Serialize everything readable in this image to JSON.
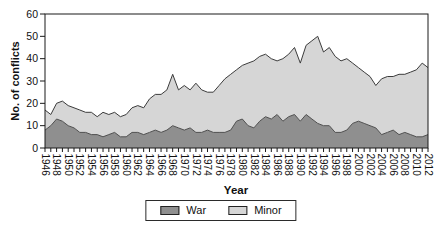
{
  "figure": {
    "ylabel": "No. of conflicts",
    "xlabel": "Year",
    "background": "#ffffff",
    "frame_color": "#1a1a1a"
  },
  "chart_data": {
    "type": "area",
    "stacked": true,
    "title": "",
    "xlabel": "Year",
    "ylabel": "No. of conflicts",
    "ylim": [
      0,
      60
    ],
    "yticks": [
      0,
      10,
      20,
      30,
      40,
      50,
      60
    ],
    "x_start": 1946,
    "x_end": 2012,
    "xtick_label_every": 2,
    "grid": false,
    "legend_position": "bottom-center",
    "x": [
      1946,
      1947,
      1948,
      1949,
      1950,
      1951,
      1952,
      1953,
      1954,
      1955,
      1956,
      1957,
      1958,
      1959,
      1960,
      1961,
      1962,
      1963,
      1964,
      1965,
      1966,
      1967,
      1968,
      1969,
      1970,
      1971,
      1972,
      1973,
      1974,
      1975,
      1976,
      1977,
      1978,
      1979,
      1980,
      1981,
      1982,
      1983,
      1984,
      1985,
      1986,
      1987,
      1988,
      1989,
      1990,
      1991,
      1992,
      1993,
      1994,
      1995,
      1996,
      1997,
      1998,
      1999,
      2000,
      2001,
      2002,
      2003,
      2004,
      2005,
      2006,
      2007,
      2008,
      2009,
      2010,
      2011,
      2012
    ],
    "series": [
      {
        "name": "War",
        "color": "#8f8f8f",
        "outline_color": "#4f4f4f",
        "values": [
          8,
          10,
          13,
          12,
          10,
          9,
          7,
          7,
          6,
          6,
          5,
          6,
          7,
          5,
          5,
          7,
          7,
          6,
          7,
          8,
          7,
          8,
          10,
          9,
          8,
          9,
          7,
          7,
          8,
          7,
          7,
          7,
          8,
          12,
          13,
          10,
          9,
          12,
          14,
          13,
          15,
          12,
          14,
          15,
          12,
          15,
          13,
          11,
          10,
          10,
          7,
          7,
          8,
          11,
          12,
          11,
          10,
          9,
          6,
          7,
          8,
          6,
          7,
          6,
          5,
          5,
          6
        ]
      },
      {
        "name": "Minor",
        "color": "#d6d6d6",
        "outline_color": "#3c3c3c",
        "values": [
          9,
          5,
          7,
          9,
          9,
          9,
          10,
          9,
          10,
          8,
          11,
          9,
          9,
          9,
          10,
          11,
          12,
          12,
          15,
          16,
          17,
          18,
          23,
          17,
          20,
          17,
          22,
          19,
          17,
          18,
          21,
          24,
          25,
          23,
          24,
          28,
          30,
          29,
          28,
          27,
          24,
          28,
          28,
          30,
          26,
          31,
          35,
          39,
          33,
          35,
          34,
          32,
          32,
          27,
          24,
          23,
          22,
          19,
          25,
          25,
          24,
          27,
          26,
          28,
          30,
          33,
          30
        ]
      }
    ]
  }
}
